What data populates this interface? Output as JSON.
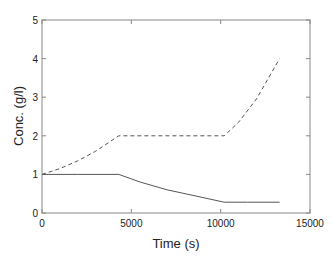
{
  "chart_data": {
    "type": "line",
    "title": "",
    "xlabel": "Time (s)",
    "ylabel": "Conc. (g/l)",
    "xlim": [
      0,
      15000
    ],
    "ylim": [
      0,
      5
    ],
    "xticks": [
      0,
      5000,
      10000,
      15000
    ],
    "yticks": [
      0,
      1,
      2,
      3,
      4,
      5
    ],
    "grid": false,
    "legend": null,
    "series": [
      {
        "name": "dashed",
        "style": "dashed",
        "x": [
          0,
          1000,
          2000,
          3000,
          4300,
          6000,
          8000,
          10200,
          11000,
          12000,
          13300
        ],
        "y": [
          1.0,
          1.15,
          1.35,
          1.6,
          2.0,
          2.0,
          2.0,
          2.0,
          2.35,
          2.95,
          4.0
        ]
      },
      {
        "name": "solid",
        "style": "solid",
        "x": [
          0,
          2000,
          4300,
          5500,
          7000,
          8500,
          10200,
          11500,
          13300
        ],
        "y": [
          1.0,
          1.0,
          1.0,
          0.8,
          0.6,
          0.45,
          0.28,
          0.28,
          0.28
        ]
      }
    ]
  }
}
